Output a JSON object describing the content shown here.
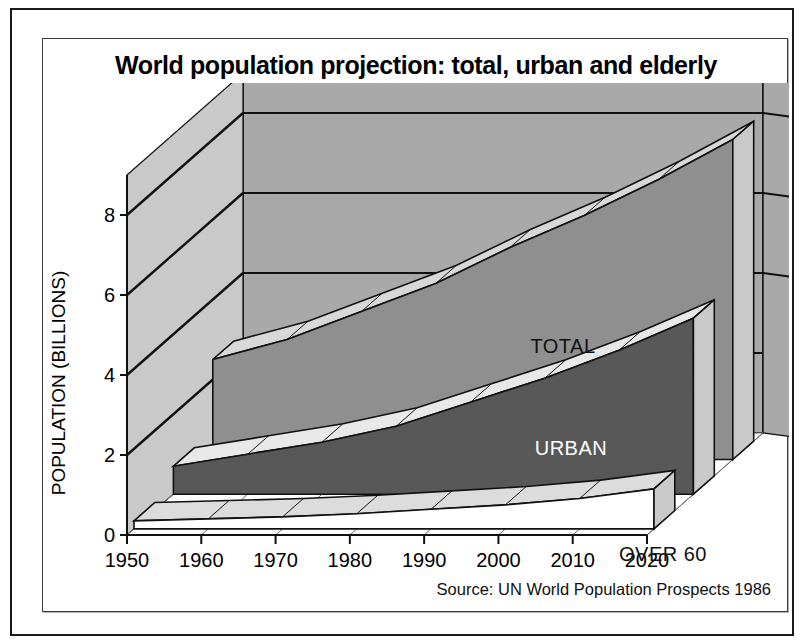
{
  "panel": {
    "title": "World population projection: total, urban and elderly",
    "source": "Source: UN World Population Prospects 1986"
  },
  "axes": {
    "ylabel": "POPULATION (BILLIONS)",
    "yticks": [
      "0",
      "2",
      "4",
      "6",
      "8"
    ],
    "xticks": [
      "1950",
      "1960",
      "1970",
      "1980",
      "1990",
      "2000",
      "2010",
      "2020"
    ]
  },
  "series_labels": {
    "total": "TOTAL",
    "urban": "URBAN",
    "over60": "OVER 60"
  },
  "colors": {
    "back_wall": "#a9a9a9",
    "left_wall": "#c9c9c9",
    "floor": "#ffffff",
    "total_face": "#8f8f8f",
    "total_top": "#d8d8d8",
    "urban_face": "#585858",
    "urban_top": "#e8e8e8",
    "over60_face": "#ffffff",
    "over60_top": "#dcdcdc",
    "outline": "#111111"
  },
  "chart_data": {
    "type": "area",
    "title": "World population projection: total, urban and elderly",
    "subtitle": "",
    "xlabel": "",
    "ylabel": "POPULATION (BILLIONS)",
    "x": [
      1950,
      1960,
      1970,
      1980,
      1990,
      2000,
      2010,
      2020
    ],
    "xlim": [
      1950,
      2020
    ],
    "ylim": [
      0,
      9
    ],
    "yticks": [
      0,
      2,
      4,
      6,
      8
    ],
    "grid": true,
    "legend": "inline-labels",
    "note": "3-D stacked ribbon chart; three separate ribbons drawn back-to-front: TOTAL, URBAN, OVER 60",
    "series": [
      {
        "name": "TOTAL",
        "values": [
          2.5,
          3.0,
          3.7,
          4.4,
          5.3,
          6.1,
          7.0,
          8.0
        ]
      },
      {
        "name": "URBAN",
        "values": [
          0.7,
          1.0,
          1.3,
          1.7,
          2.3,
          2.9,
          3.6,
          4.4
        ]
      },
      {
        "name": "OVER 60",
        "values": [
          0.2,
          0.25,
          0.3,
          0.38,
          0.49,
          0.6,
          0.76,
          1.0
        ]
      }
    ],
    "annotations": [
      "Source: UN World Population Prospects 1986"
    ]
  }
}
